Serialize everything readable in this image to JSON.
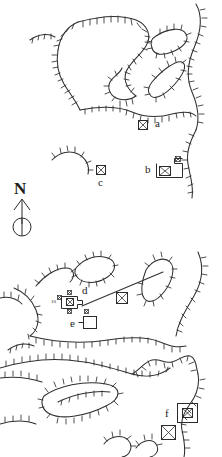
{
  "figure": {
    "kind": "archaeological-earthwork-survey-plan",
    "background_color": "#ffffff",
    "ink_color": "#2b2b2b",
    "width": 222,
    "height": 457
  },
  "north_arrow": {
    "label": "N",
    "symbol_name": "north-arrow-with-circle"
  },
  "feature_labels": [
    {
      "id": "a",
      "text": "a",
      "x": 156,
      "y": 121
    },
    {
      "id": "b",
      "text": "b",
      "x": 146,
      "y": 165
    },
    {
      "id": "c",
      "text": "c",
      "x": 102,
      "y": 184
    },
    {
      "id": "d",
      "text": "d",
      "x": 84,
      "y": 292
    },
    {
      "id": "e",
      "text": "e",
      "x": 72,
      "y": 322
    },
    {
      "id": "f",
      "text": "f",
      "x": 166,
      "y": 413
    }
  ],
  "small_labels": [
    {
      "id": "ten",
      "text": "10",
      "x": 64,
      "y": 302
    }
  ],
  "symbols": {
    "crossed_square_name": "crossed-square-marker",
    "plain_square_name": "plain-square-marker",
    "markers": [
      {
        "name": "marker-a",
        "type": "crossed-square",
        "x": 143,
        "y": 125,
        "size": 9
      },
      {
        "name": "marker-b-main",
        "type": "crossed-square",
        "x": 165,
        "y": 169,
        "size": 10
      },
      {
        "name": "marker-b-small",
        "type": "crossed-square",
        "x": 177,
        "y": 159,
        "size": 5
      },
      {
        "name": "marker-c",
        "type": "crossed-square",
        "x": 100,
        "y": 170,
        "size": 9
      },
      {
        "name": "marker-d-center",
        "type": "crossed-square",
        "x": 70,
        "y": 302,
        "size": 7
      },
      {
        "name": "marker-d-nw",
        "type": "crossed-square",
        "x": 63,
        "y": 297,
        "size": 4
      },
      {
        "name": "marker-d-n",
        "type": "crossed-square",
        "x": 72,
        "y": 293,
        "size": 4
      },
      {
        "name": "marker-d-s",
        "type": "crossed-square",
        "x": 71,
        "y": 311,
        "size": 4
      },
      {
        "name": "marker-track",
        "type": "crossed-square",
        "x": 122,
        "y": 297,
        "size": 10
      },
      {
        "name": "marker-e-small",
        "type": "crossed-square",
        "x": 86,
        "y": 313,
        "size": 4
      },
      {
        "name": "marker-f-inner",
        "type": "crossed-square",
        "x": 186,
        "y": 412,
        "size": 9
      },
      {
        "name": "marker-f-lower",
        "type": "crossed-square",
        "x": 170,
        "y": 435,
        "size": 11
      },
      {
        "name": "marker-bottom-right",
        "type": "crossed-square",
        "x": 167,
        "y": 432,
        "size": 11
      }
    ],
    "enclosures": [
      {
        "name": "enclosure-b",
        "x": 156,
        "y": 162,
        "w": 26,
        "h": 16
      },
      {
        "name": "enclosure-d",
        "x": 62,
        "y": 296,
        "w": 19,
        "h": 13
      },
      {
        "name": "enclosure-e",
        "x": 84,
        "y": 316,
        "w": 13,
        "h": 12
      },
      {
        "name": "enclosure-f",
        "x": 178,
        "y": 404,
        "w": 19,
        "h": 18
      }
    ]
  },
  "linework": {
    "hachured_scarps_name": "hachured-scarp-line",
    "trackway_name": "straight-trackway-line",
    "description": "Hand-drawn hachured scarp/bank lines delineating earthwork terraces, plus one long straight trackway."
  }
}
